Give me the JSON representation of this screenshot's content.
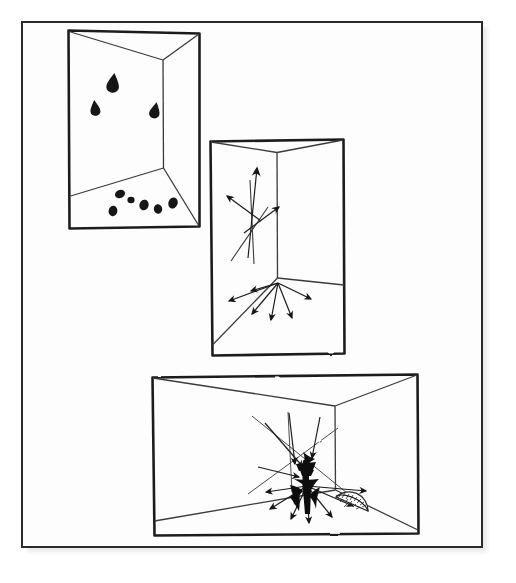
{
  "figure": {
    "kind": "hand-drawn-diagram",
    "description": "A scanned hand-drawn illustration showing three perspective drawings of an interior room corner. Panel one: scattered dark teardrop marks on the walls and floor. Panel two: arrows radiating outward from the floor corner and crossing lines on the left wall. Panel three: a wide room with many arrows converging on a dense dark cluster near the corner, plus a small protractor fan.",
    "background_color": "#fdfdfd",
    "ink_color": "#1a1a1a",
    "paper_color": "#ffffff",
    "border_color": "#2b2b2b",
    "shadow_color": "#b9b9b9"
  },
  "frame": {
    "label": "outer-page-frame",
    "x": 22,
    "y": 22,
    "width": 460,
    "height": 525,
    "stroke_width": 2,
    "has_drop_shadow": true
  },
  "panels": [
    {
      "id": "panel-1",
      "label": "Panel 1 — corner with scattered marks",
      "x": 68,
      "y": 30,
      "width": 132,
      "height": 198,
      "corner_x": 163,
      "corner_top_y": 60,
      "corner_bottom_y": 168,
      "floor_left_x": 68,
      "floor_left_y": 196,
      "content_type": "scattered-marks",
      "mark_count": 9,
      "wall_marks": [
        {
          "x": 113,
          "y": 80,
          "w": 7,
          "h": 11,
          "rot": 8
        },
        {
          "x": 95,
          "y": 106,
          "w": 6,
          "h": 10,
          "rot": -6
        },
        {
          "x": 155,
          "y": 109,
          "w": 6,
          "h": 11,
          "rot": 10
        }
      ],
      "floor_marks": [
        {
          "x": 120,
          "y": 194,
          "w": 8,
          "h": 8,
          "rot": -20
        },
        {
          "x": 112,
          "y": 210,
          "w": 7,
          "h": 9,
          "rot": 5
        },
        {
          "x": 143,
          "y": 205,
          "w": 8,
          "h": 9,
          "rot": 14
        },
        {
          "x": 157,
          "y": 209,
          "w": 7,
          "h": 9,
          "rot": -8
        },
        {
          "x": 173,
          "y": 204,
          "w": 8,
          "h": 10,
          "rot": 18
        },
        {
          "x": 131,
          "y": 201,
          "w": 6,
          "h": 7,
          "rot": 0
        }
      ]
    },
    {
      "id": "panel-2",
      "label": "Panel 2 — corner with radiating arrows",
      "x": 210,
      "y": 140,
      "width": 134,
      "height": 215,
      "corner_x": 277,
      "corner_top_y": 152,
      "corner_bottom_y": 278,
      "floor_left_x": 210,
      "floor_left_y": 345,
      "content_type": "radiating-arrows",
      "arrow_count": 9,
      "wall_arrows": [
        {
          "x1": 247,
          "y1": 257,
          "x2": 257,
          "y2": 162,
          "head": 11
        },
        {
          "x1": 262,
          "y1": 220,
          "x2": 224,
          "y2": 192,
          "head": 10
        },
        {
          "x1": 243,
          "y1": 232,
          "x2": 281,
          "y2": 204,
          "head": 10
        }
      ],
      "wall_lines": [
        {
          "x1": 231,
          "y1": 258,
          "x2": 262,
          "y2": 215
        },
        {
          "x1": 253,
          "y1": 262,
          "x2": 250,
          "y2": 176
        }
      ],
      "floor_arrows": [
        {
          "x1": 277,
          "y1": 284,
          "x2": 226,
          "y2": 302,
          "head": 10
        },
        {
          "x1": 277,
          "y1": 284,
          "x2": 248,
          "y2": 290,
          "head": 10
        },
        {
          "x1": 277,
          "y1": 284,
          "x2": 250,
          "y2": 316,
          "head": 10
        },
        {
          "x1": 277,
          "y1": 284,
          "x2": 269,
          "y2": 322,
          "head": 10
        },
        {
          "x1": 277,
          "y1": 284,
          "x2": 292,
          "y2": 320,
          "head": 10
        },
        {
          "x1": 277,
          "y1": 284,
          "x2": 312,
          "y2": 300,
          "head": 10
        }
      ]
    },
    {
      "id": "panel-3",
      "label": "Panel 3 — wide room, converging arrows and protractor fan",
      "x": 152,
      "y": 375,
      "width": 266,
      "height": 160,
      "corner_x": 335,
      "corner_top_y": 405,
      "corner_bottom_y": 490,
      "floor_left_x": 152,
      "floor_left_y": 520,
      "content_type": "converging-arrows-with-protractor",
      "cluster": {
        "x": 307,
        "y": 470,
        "label": "dense-dark-arrow-cluster",
        "width": 26,
        "height": 58
      },
      "incoming_arrows": [
        {
          "x1": 266,
          "y1": 424,
          "x2": 306,
          "y2": 470,
          "head": 9
        },
        {
          "x1": 290,
          "y1": 414,
          "x2": 296,
          "y2": 468,
          "head": 9
        },
        {
          "x1": 318,
          "y1": 418,
          "x2": 311,
          "y2": 462,
          "head": 9
        },
        {
          "x1": 260,
          "y1": 468,
          "x2": 302,
          "y2": 478,
          "head": 9
        }
      ],
      "outgoing_arrows": [
        {
          "x1": 308,
          "y1": 485,
          "x2": 268,
          "y2": 492,
          "head": 9
        },
        {
          "x1": 308,
          "y1": 485,
          "x2": 272,
          "y2": 508,
          "head": 9
        },
        {
          "x1": 308,
          "y1": 485,
          "x2": 292,
          "y2": 518,
          "head": 9
        },
        {
          "x1": 308,
          "y1": 485,
          "x2": 310,
          "y2": 522,
          "head": 9
        },
        {
          "x1": 308,
          "y1": 485,
          "x2": 332,
          "y2": 516,
          "head": 9
        },
        {
          "x1": 308,
          "y1": 485,
          "x2": 352,
          "y2": 505,
          "head": 9
        },
        {
          "x1": 308,
          "y1": 485,
          "x2": 364,
          "y2": 490,
          "head": 9
        }
      ],
      "long_lines": [
        {
          "x1": 252,
          "y1": 416,
          "x2": 366,
          "y2": 508
        },
        {
          "x1": 336,
          "y1": 430,
          "x2": 250,
          "y2": 492
        }
      ],
      "protractor": {
        "x": 353,
        "y": 505,
        "radius": 18,
        "tick_count": 14,
        "label": "protractor-fan"
      }
    }
  ]
}
